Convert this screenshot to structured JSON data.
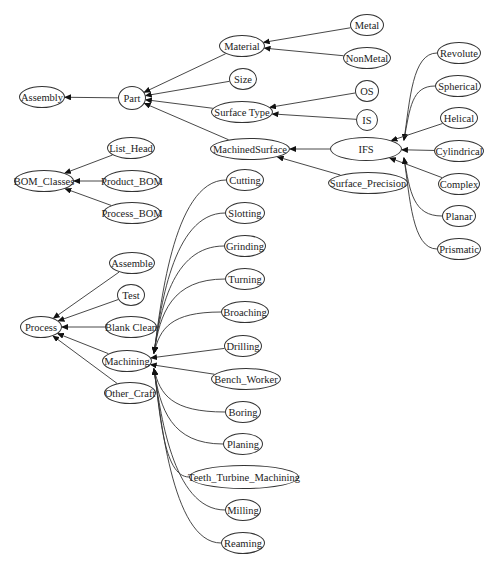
{
  "diagram": {
    "type": "directed-graph",
    "colors": {
      "stroke": "#333333",
      "background": "#ffffff",
      "text": "#222222"
    },
    "nodes": [
      {
        "id": "Assembly",
        "label": "Assembly",
        "x": 42,
        "y": 97,
        "w": 46,
        "h": 22
      },
      {
        "id": "Part",
        "label": "Part",
        "x": 132,
        "y": 98,
        "w": 28,
        "h": 24
      },
      {
        "id": "Material",
        "label": "Material",
        "x": 242,
        "y": 46,
        "w": 46,
        "h": 22
      },
      {
        "id": "Size",
        "label": "Size",
        "x": 243,
        "y": 79,
        "w": 28,
        "h": 22
      },
      {
        "id": "SurfaceType",
        "label": "Surface Type",
        "x": 242,
        "y": 112,
        "w": 62,
        "h": 22
      },
      {
        "id": "MachinedSurface",
        "label": "MachinedSurface",
        "x": 250,
        "y": 149,
        "w": 80,
        "h": 22
      },
      {
        "id": "Metal",
        "label": "Metal",
        "x": 367,
        "y": 25,
        "w": 34,
        "h": 22
      },
      {
        "id": "NonMetal",
        "label": "NonMetal",
        "x": 367,
        "y": 58,
        "w": 48,
        "h": 22
      },
      {
        "id": "OS",
        "label": "OS",
        "x": 367,
        "y": 91,
        "w": 24,
        "h": 22
      },
      {
        "id": "IS",
        "label": "IS",
        "x": 367,
        "y": 120,
        "w": 22,
        "h": 22
      },
      {
        "id": "IFS",
        "label": "IFS",
        "x": 366,
        "y": 149,
        "w": 72,
        "h": 24
      },
      {
        "id": "SurfacePrecision",
        "label": "Surface_Precision",
        "x": 368,
        "y": 183,
        "w": 80,
        "h": 22
      },
      {
        "id": "Revolute",
        "label": "Revolute",
        "x": 459,
        "y": 53,
        "w": 44,
        "h": 22
      },
      {
        "id": "Spherical",
        "label": "Spherical",
        "x": 458,
        "y": 86,
        "w": 46,
        "h": 22
      },
      {
        "id": "Helical",
        "label": "Helical",
        "x": 459,
        "y": 118,
        "w": 38,
        "h": 22
      },
      {
        "id": "Cylindrical",
        "label": "Cylindrical",
        "x": 459,
        "y": 151,
        "w": 50,
        "h": 22
      },
      {
        "id": "Complex",
        "label": "Complex",
        "x": 459,
        "y": 184,
        "w": 42,
        "h": 22
      },
      {
        "id": "Planar",
        "label": "Planar",
        "x": 459,
        "y": 216,
        "w": 34,
        "h": 22
      },
      {
        "id": "Prismatic",
        "label": "Prismatic",
        "x": 459,
        "y": 249,
        "w": 44,
        "h": 22
      },
      {
        "id": "BOM_Classes",
        "label": "BOM_Classes",
        "x": 44,
        "y": 181,
        "w": 60,
        "h": 22
      },
      {
        "id": "List_Head",
        "label": "List_Head",
        "x": 131,
        "y": 148,
        "w": 48,
        "h": 22
      },
      {
        "id": "Product_BOM",
        "label": "Product_BOM",
        "x": 132,
        "y": 181,
        "w": 58,
        "h": 22
      },
      {
        "id": "Process_BOM",
        "label": "Process_BOM",
        "x": 132,
        "y": 213,
        "w": 58,
        "h": 22
      },
      {
        "id": "Process",
        "label": "Process",
        "x": 41,
        "y": 327,
        "w": 42,
        "h": 22
      },
      {
        "id": "Assemble",
        "label": "Assemble",
        "x": 132,
        "y": 263,
        "w": 46,
        "h": 22
      },
      {
        "id": "Test",
        "label": "Test",
        "x": 131,
        "y": 295,
        "w": 28,
        "h": 22
      },
      {
        "id": "BlankClean",
        "label": "Blank Clean",
        "x": 131,
        "y": 327,
        "w": 52,
        "h": 22
      },
      {
        "id": "Machining",
        "label": "Machining",
        "x": 127,
        "y": 361,
        "w": 50,
        "h": 22
      },
      {
        "id": "Other_Craft",
        "label": "Other_Craft",
        "x": 130,
        "y": 393,
        "w": 52,
        "h": 22
      },
      {
        "id": "Cutting",
        "label": "Cutting",
        "x": 245,
        "y": 180,
        "w": 38,
        "h": 22
      },
      {
        "id": "Slotting",
        "label": "Slotting",
        "x": 245,
        "y": 213,
        "w": 40,
        "h": 22
      },
      {
        "id": "Grinding",
        "label": "Grinding",
        "x": 245,
        "y": 246,
        "w": 42,
        "h": 22
      },
      {
        "id": "Turning",
        "label": "Turning",
        "x": 245,
        "y": 279,
        "w": 40,
        "h": 22
      },
      {
        "id": "Broaching",
        "label": "Broaching",
        "x": 245,
        "y": 312,
        "w": 48,
        "h": 22
      },
      {
        "id": "Drilling",
        "label": "Drilling",
        "x": 243,
        "y": 346,
        "w": 38,
        "h": 22
      },
      {
        "id": "Bench_Worker",
        "label": "Bench_Worker",
        "x": 246,
        "y": 379,
        "w": 70,
        "h": 22
      },
      {
        "id": "Boring",
        "label": "Boring",
        "x": 243,
        "y": 412,
        "w": 36,
        "h": 22
      },
      {
        "id": "Planing",
        "label": "Planing",
        "x": 243,
        "y": 444,
        "w": 40,
        "h": 22
      },
      {
        "id": "Teeth_Turbine_Machining",
        "label": "Teeth_Turbine_Machining",
        "x": 244,
        "y": 477,
        "w": 110,
        "h": 24
      },
      {
        "id": "Milling",
        "label": "Milling",
        "x": 243,
        "y": 510,
        "w": 36,
        "h": 22
      },
      {
        "id": "Reaming",
        "label": "Reaming",
        "x": 243,
        "y": 543,
        "w": 44,
        "h": 22
      }
    ],
    "edges": [
      {
        "from": "Part",
        "to": "Assembly",
        "curve": "straight"
      },
      {
        "from": "Material",
        "to": "Part",
        "curve": "straight"
      },
      {
        "from": "Size",
        "to": "Part",
        "curve": "straight"
      },
      {
        "from": "SurfaceType",
        "to": "Part",
        "curve": "straight"
      },
      {
        "from": "MachinedSurface",
        "to": "Part",
        "curve": "straight"
      },
      {
        "from": "Metal",
        "to": "Material",
        "curve": "straight"
      },
      {
        "from": "NonMetal",
        "to": "Material",
        "curve": "straight"
      },
      {
        "from": "OS",
        "to": "SurfaceType",
        "curve": "straight"
      },
      {
        "from": "IS",
        "to": "SurfaceType",
        "curve": "straight"
      },
      {
        "from": "IFS",
        "to": "MachinedSurface",
        "curve": "straight"
      },
      {
        "from": "SurfacePrecision",
        "to": "MachinedSurface",
        "curve": "straight"
      },
      {
        "from": "Revolute",
        "to": "IFS",
        "curve": "arc"
      },
      {
        "from": "Spherical",
        "to": "IFS",
        "curve": "arc"
      },
      {
        "from": "Helical",
        "to": "IFS",
        "curve": "straight"
      },
      {
        "from": "Cylindrical",
        "to": "IFS",
        "curve": "straight"
      },
      {
        "from": "Complex",
        "to": "IFS",
        "curve": "straight"
      },
      {
        "from": "Planar",
        "to": "IFS",
        "curve": "arc"
      },
      {
        "from": "Prismatic",
        "to": "IFS",
        "curve": "arc"
      },
      {
        "from": "List_Head",
        "to": "BOM_Classes",
        "curve": "straight"
      },
      {
        "from": "Product_BOM",
        "to": "BOM_Classes",
        "curve": "straight"
      },
      {
        "from": "Process_BOM",
        "to": "BOM_Classes",
        "curve": "straight"
      },
      {
        "from": "Assemble",
        "to": "Process",
        "curve": "straight"
      },
      {
        "from": "Test",
        "to": "Process",
        "curve": "straight"
      },
      {
        "from": "BlankClean",
        "to": "Process",
        "curve": "straight"
      },
      {
        "from": "Machining",
        "to": "Process",
        "curve": "straight"
      },
      {
        "from": "Other_Craft",
        "to": "Process",
        "curve": "straight"
      },
      {
        "from": "Cutting",
        "to": "Machining",
        "curve": "arc"
      },
      {
        "from": "Slotting",
        "to": "Machining",
        "curve": "arc"
      },
      {
        "from": "Grinding",
        "to": "Machining",
        "curve": "arc"
      },
      {
        "from": "Turning",
        "to": "Machining",
        "curve": "arc"
      },
      {
        "from": "Broaching",
        "to": "Machining",
        "curve": "arc"
      },
      {
        "from": "Drilling",
        "to": "Machining",
        "curve": "straight"
      },
      {
        "from": "Bench_Worker",
        "to": "Machining",
        "curve": "straight"
      },
      {
        "from": "Boring",
        "to": "Machining",
        "curve": "arc"
      },
      {
        "from": "Planing",
        "to": "Machining",
        "curve": "arc"
      },
      {
        "from": "Teeth_Turbine_Machining",
        "to": "Machining",
        "curve": "arc"
      },
      {
        "from": "Milling",
        "to": "Machining",
        "curve": "arc"
      },
      {
        "from": "Reaming",
        "to": "Machining",
        "curve": "arc"
      }
    ]
  }
}
